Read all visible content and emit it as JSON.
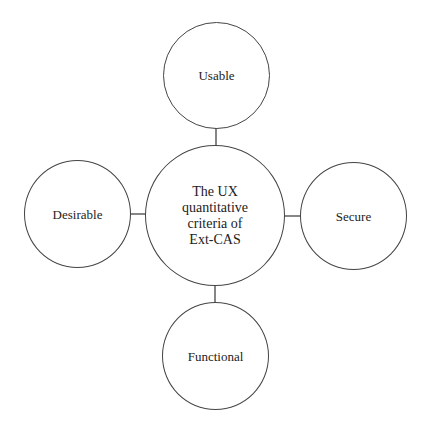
{
  "diagram": {
    "center": {
      "label": "The UX quantitative criteria of Ext-CAS",
      "lines": [
        "The UX",
        "quantitative",
        "criteria of",
        "Ext-CAS"
      ]
    },
    "nodes": {
      "top": {
        "label": "Usable"
      },
      "left": {
        "label": "Desirable"
      },
      "right": {
        "label": "Secure"
      },
      "bottom": {
        "label": "Functional"
      }
    },
    "colors": {
      "stroke": "#444444",
      "text": "#222222",
      "background": "#ffffff"
    }
  }
}
